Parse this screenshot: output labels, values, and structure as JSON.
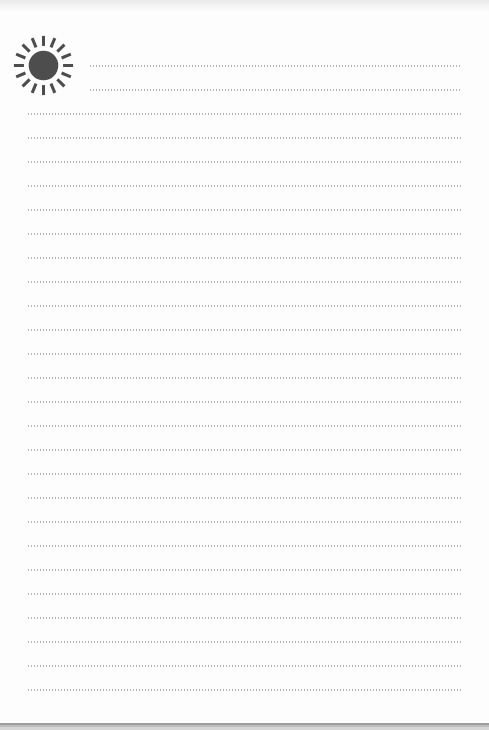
{
  "page": {
    "background": "#fdfdfd",
    "top_edge_color": "#e9e9e9",
    "bottom_edge_color": "#9e9e9e"
  },
  "sun_icon": {
    "name": "sun-icon",
    "color": "#4d4d4d",
    "ray_count": 16,
    "circle_radius": 15.5,
    "ray_inner_radius": 20.5,
    "ray_outer_radius": 31,
    "ray_width": 3.2
  },
  "ruled_lines": {
    "dot_color": "#b3b3b3",
    "dot_width_px": 1,
    "dot_pitch_px": 3,
    "count": 27,
    "first_line_y": 66,
    "spacing": 24,
    "indented_count": 2,
    "indent_left": 90,
    "full_left": 28,
    "right_end": 462
  }
}
